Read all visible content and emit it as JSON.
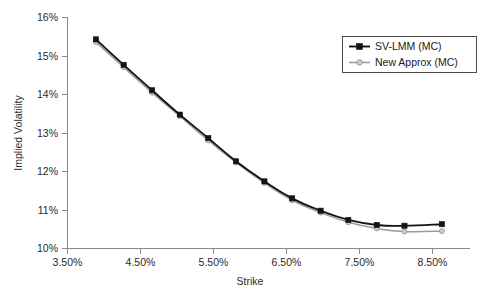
{
  "chart_data": {
    "type": "line",
    "title": "",
    "xlabel": "Strike",
    "ylabel": "Implied Volatility",
    "xlim": [
      3.5,
      8.875
    ],
    "ylim": [
      10,
      16
    ],
    "grid": false,
    "legend_position": "top-right",
    "x_tick_labels": [
      "3.50%",
      "4.50%",
      "5.50%",
      "6.50%",
      "7.50%",
      "8.50%"
    ],
    "x_tick_values": [
      3.5,
      4.5,
      5.5,
      6.5,
      7.5,
      8.5
    ],
    "y_tick_labels": [
      "10%",
      "11%",
      "12%",
      "13%",
      "14%",
      "15%",
      "16%"
    ],
    "y_tick_values": [
      10,
      11,
      12,
      13,
      14,
      15,
      16
    ],
    "x": [
      3.88,
      4.25,
      4.63,
      5.0,
      5.38,
      5.75,
      6.13,
      6.5,
      6.88,
      7.25,
      7.63,
      8.0,
      8.5
    ],
    "series": [
      {
        "name": "SV-LMM (MC)",
        "color": "#141414",
        "marker": "square",
        "values": [
          15.42,
          14.76,
          14.1,
          13.47,
          12.86,
          12.26,
          11.74,
          11.3,
          10.98,
          10.74,
          10.61,
          10.59,
          10.63
        ]
      },
      {
        "name": "New Approx (MC)",
        "color": "#9a9a9a",
        "marker": "circle",
        "values": [
          15.35,
          14.7,
          14.04,
          13.43,
          12.8,
          12.23,
          11.7,
          11.25,
          10.93,
          10.68,
          10.52,
          10.44,
          10.45
        ]
      }
    ]
  },
  "legend": {
    "entries": [
      {
        "label": "SV-LMM (MC)"
      },
      {
        "label": "New Approx (MC)"
      }
    ]
  },
  "axes": {
    "x_title": "Strike",
    "y_title": "Implied Volatility"
  },
  "colors": {
    "series_a": "#141414",
    "series_b": "#9a9a9a",
    "axis": "#8a8a8a",
    "background": "#ffffff"
  }
}
